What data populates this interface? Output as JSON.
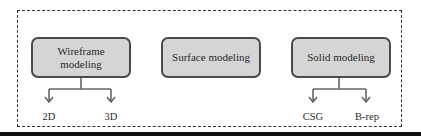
{
  "diagram": {
    "nodes": [
      {
        "id": "wireframe",
        "label_line1": "Wireframe",
        "label_line2": "modeling",
        "children": [
          "2D",
          "3D"
        ]
      },
      {
        "id": "surface",
        "label": "Surface modeling",
        "children": []
      },
      {
        "id": "solid",
        "label": "Solid modeling",
        "children": [
          "CSG",
          "B-rep"
        ]
      }
    ],
    "leaves": {
      "wireframe_left": "2D",
      "wireframe_right": "3D",
      "solid_left": "CSG",
      "solid_right": "B-rep"
    },
    "colors": {
      "node_fill": "#d5d5d5",
      "node_border": "#4a4a4a",
      "connector": "#666666",
      "frame_border": "#333333",
      "rule": "#111111"
    }
  }
}
